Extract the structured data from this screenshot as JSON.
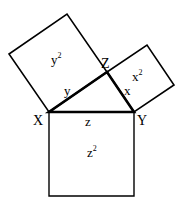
{
  "diagram": {
    "stroke_color": "#000000",
    "background": "#ffffff",
    "vertices": [
      {
        "id": "X",
        "label": "X",
        "x": 49,
        "y": 112
      },
      {
        "id": "Y",
        "label": "Y",
        "x": 134,
        "y": 112
      },
      {
        "id": "Z",
        "label": "Z",
        "x": 107,
        "y": 72
      }
    ],
    "sides": [
      {
        "id": "z",
        "label": "z",
        "from": "X",
        "to": "Y"
      },
      {
        "id": "y",
        "label": "y",
        "from": "X",
        "to": "Z"
      },
      {
        "id": "x",
        "label": "x",
        "from": "Z",
        "to": "Y"
      }
    ],
    "squares": [
      {
        "id": "y2",
        "base": "y",
        "exp": "2",
        "points": "49,112 107,72 67,14 9,54"
      },
      {
        "id": "x2",
        "base": "x",
        "exp": "2",
        "points": "107,72 134,112 174,85 147,45"
      },
      {
        "id": "z2",
        "base": "z",
        "exp": "2",
        "points": "49,112 134,112 134,196 49,196"
      }
    ]
  }
}
